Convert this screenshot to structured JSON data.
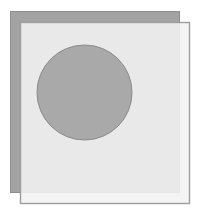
{
  "diagram": {
    "canvas": {
      "width": 207,
      "height": 216,
      "background": "#ffffff"
    },
    "back_rect": {
      "x": 10,
      "y": 11,
      "width": 169,
      "height": 181,
      "fill": "#a3a3a3",
      "stroke": "#8e8e8e"
    },
    "front_rect": {
      "x": 20,
      "y": 22,
      "width": 169,
      "height": 181,
      "fill": "#f2f2f2",
      "fill_opacity": 0.88,
      "stroke": "#9e9e9e"
    },
    "circle": {
      "cx": 84.5,
      "cy": 92.5,
      "r": 47.5,
      "fill": "#a9a9a9",
      "stroke": "#8a8a8a"
    }
  }
}
